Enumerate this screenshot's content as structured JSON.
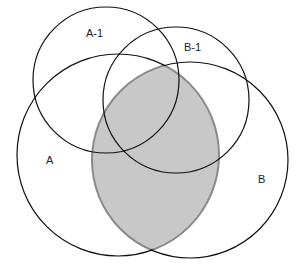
{
  "diagram": {
    "type": "venn",
    "sets": [
      {
        "id": "A-1",
        "label": "A-1"
      },
      {
        "id": "B-1",
        "label": "B-1"
      },
      {
        "id": "A",
        "label": "A"
      },
      {
        "id": "B",
        "label": "B"
      }
    ],
    "highlighted_region": "A ∩ B",
    "colors": {
      "stroke": "#111111",
      "highlight_fill": "#c8c8c8",
      "highlight_stroke": "#8a8a8a",
      "background": "#ffffff"
    }
  }
}
